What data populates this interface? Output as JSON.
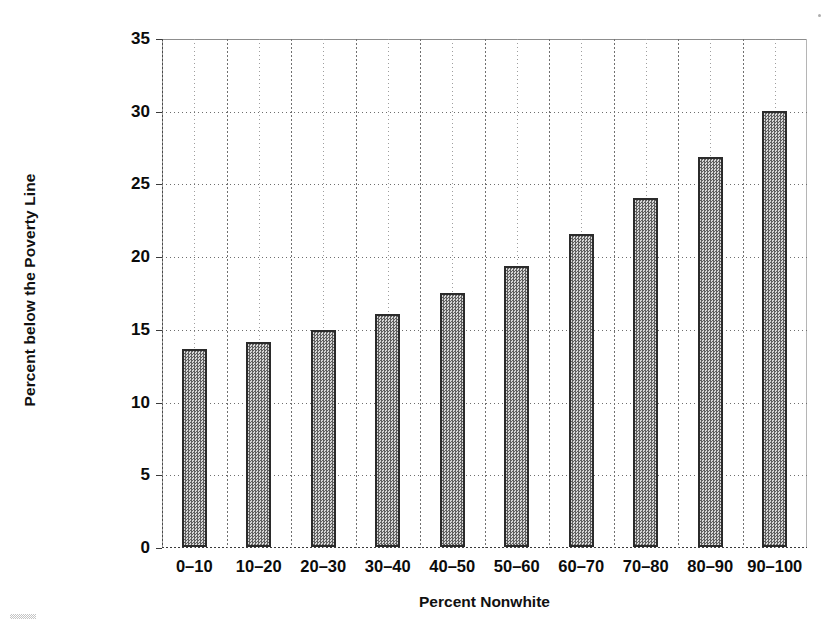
{
  "chart_data": {
    "type": "bar",
    "title": "",
    "subtitle": "",
    "xlabel": "Percent Nonwhite",
    "ylabel": "Percent below the Poverty Line",
    "categories": [
      "0–10",
      "10–20",
      "20–30",
      "30–40",
      "40–50",
      "50–60",
      "60–70",
      "70–80",
      "80–90",
      "90–100"
    ],
    "values": [
      13.6,
      14.1,
      14.9,
      16.0,
      17.5,
      19.3,
      21.5,
      24.0,
      26.8,
      30.0
    ],
    "ylim": [
      0,
      35
    ],
    "ytick_step": 5,
    "ytick_labels": [
      "0",
      "5",
      "10",
      "15",
      "20",
      "25",
      "30",
      "35"
    ],
    "ytick_values": [
      0,
      5,
      10,
      15,
      20,
      25,
      30,
      35
    ],
    "grid": "both-dotted",
    "legend": "none",
    "legend_position": "none",
    "bar_fill": "#9a9a9a",
    "bar_fill_pattern": "checker-dither",
    "bar_border": "#2b2b2b",
    "background": "#ffffff"
  },
  "figure": {
    "y_axis_title": "Percent below the Poverty Line",
    "x_axis_title": "Percent Nonwhite"
  }
}
